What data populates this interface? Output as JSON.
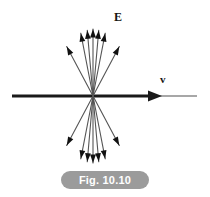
{
  "figure": {
    "caption": "Fig. 10.10",
    "caption_bg_color": "#9b9b9b",
    "caption_text_color": "#ffffff",
    "background_color": "#ffffff"
  },
  "labels": {
    "field_label": "E",
    "velocity_label": "v",
    "label_color": "#141414"
  },
  "diagram": {
    "type": "vector-field",
    "center_x": 93,
    "center_y": 96,
    "line_color": "#555555",
    "arrow_color": "#111111",
    "axis_color": "#8a8a8a",
    "axis_arrow_color": "#1a1a1a",
    "axis_x_start": 12,
    "axis_x_end": 197,
    "axis_arrow_tip_x": 162,
    "field_lines": [
      {
        "angle_deg": -118,
        "length": 56,
        "name": "ray-upper-left-outer"
      },
      {
        "angle_deg": -101,
        "length": 64,
        "name": "ray-up-left-mid"
      },
      {
        "angle_deg": -95,
        "length": 66,
        "name": "ray-up-near-vertical-a"
      },
      {
        "angle_deg": -90,
        "length": 67,
        "name": "ray-up-vertical"
      },
      {
        "angle_deg": -85,
        "length": 66,
        "name": "ray-up-near-vertical-b"
      },
      {
        "angle_deg": -79,
        "length": 64,
        "name": "ray-up-right-mid"
      },
      {
        "angle_deg": -62,
        "length": 56,
        "name": "ray-upper-right-outer"
      },
      {
        "angle_deg": 118,
        "length": 56,
        "name": "ray-lower-left-outer"
      },
      {
        "angle_deg": 101,
        "length": 64,
        "name": "ray-down-left-mid"
      },
      {
        "angle_deg": 95,
        "length": 66,
        "name": "ray-down-near-vertical-a"
      },
      {
        "angle_deg": 90,
        "length": 67,
        "name": "ray-down-vertical"
      },
      {
        "angle_deg": 85,
        "length": 66,
        "name": "ray-down-near-vertical-b"
      },
      {
        "angle_deg": 79,
        "length": 64,
        "name": "ray-down-right-mid"
      },
      {
        "angle_deg": 62,
        "length": 56,
        "name": "ray-lower-right-outer"
      }
    ]
  }
}
